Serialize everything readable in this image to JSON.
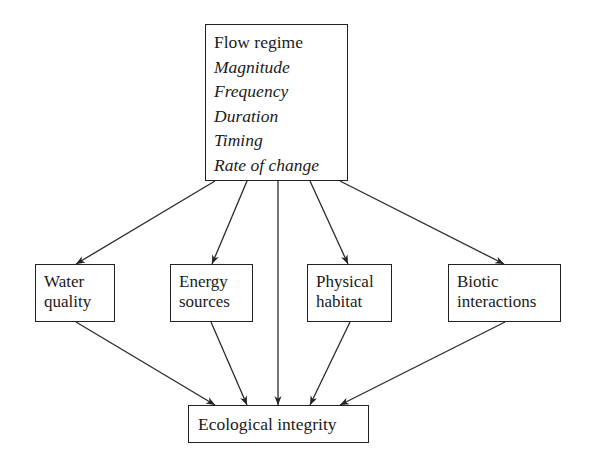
{
  "diagram": {
    "top": {
      "title": "Flow regime",
      "components": [
        "Magnitude",
        "Frequency",
        "Duration",
        "Timing",
        "Rate of change"
      ]
    },
    "middle": [
      {
        "line1": "Water",
        "line2": "quality"
      },
      {
        "line1": "Energy",
        "line2": "sources"
      },
      {
        "line1": "Physical",
        "line2": "habitat"
      },
      {
        "line1": "Biotic",
        "line2": "interactions"
      }
    ],
    "bottom": {
      "label": "Ecological integrity"
    },
    "edges": [
      {
        "from": "Flow regime",
        "to": "Water quality"
      },
      {
        "from": "Flow regime",
        "to": "Energy sources"
      },
      {
        "from": "Flow regime",
        "to": "Ecological integrity"
      },
      {
        "from": "Flow regime",
        "to": "Physical habitat"
      },
      {
        "from": "Flow regime",
        "to": "Biotic interactions"
      },
      {
        "from": "Water quality",
        "to": "Ecological integrity"
      },
      {
        "from": "Energy sources",
        "to": "Ecological integrity"
      },
      {
        "from": "Physical habitat",
        "to": "Ecological integrity"
      },
      {
        "from": "Biotic interactions",
        "to": "Ecological integrity"
      }
    ]
  }
}
